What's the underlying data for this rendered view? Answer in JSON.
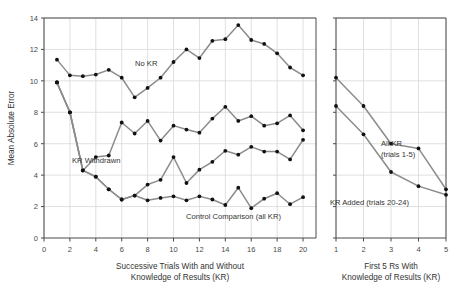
{
  "chart_data": {
    "type": "line",
    "title": "",
    "panels": [
      {
        "name": "left-panel",
        "xlabel": "Successive Trials With and Without Knowledge of Results (KR)",
        "xlabel_line1": "Successive Trials With and Without",
        "xlabel_line2": "Knowledge of Results (KR)",
        "ylabel": "Mean Absolute Error",
        "xlim": [
          0,
          21
        ],
        "ylim": [
          0,
          14
        ],
        "xticks": [
          0,
          2,
          4,
          6,
          8,
          10,
          12,
          14,
          16,
          18,
          20
        ],
        "yticks": [
          0,
          2,
          4,
          6,
          8,
          10,
          12,
          14
        ],
        "grid": true,
        "x": [
          1,
          2,
          3,
          4,
          5,
          6,
          7,
          8,
          9,
          10,
          11,
          12,
          13,
          14,
          15,
          16,
          17,
          18,
          19,
          20
        ],
        "series": [
          {
            "name": "No KR",
            "label": "No KR",
            "values": [
              11.35,
              10.35,
              10.3,
              10.4,
              10.7,
              10.2,
              8.95,
              9.55,
              10.2,
              11.2,
              12.0,
              11.45,
              12.55,
              12.65,
              13.55,
              12.6,
              12.35,
              11.75,
              10.85,
              10.35
            ]
          },
          {
            "name": "KR Withdrawn",
            "label": "KR Withdrawn",
            "values": [
              9.9,
              8.0,
              4.3,
              5.15,
              5.25,
              7.35,
              6.65,
              7.45,
              6.2,
              7.15,
              6.9,
              6.7,
              7.6,
              8.35,
              7.45,
              7.75,
              7.15,
              7.3,
              7.8,
              6.85
            ]
          },
          {
            "name": "Middle Series",
            "label": "",
            "values": [
              9.9,
              8.0,
              4.3,
              3.9,
              3.1,
              2.45,
              2.7,
              3.4,
              3.7,
              5.15,
              3.5,
              4.35,
              4.85,
              5.55,
              5.3,
              5.8,
              5.5,
              5.5,
              5.0,
              6.25
            ]
          },
          {
            "name": "Control Comparison (all KR)",
            "label": "Control Comparison (all KR)",
            "values": [
              9.9,
              8.0,
              4.3,
              3.9,
              3.1,
              2.45,
              2.7,
              2.4,
              2.55,
              2.65,
              2.4,
              2.65,
              2.45,
              2.1,
              3.2,
              1.9,
              2.5,
              2.85,
              2.15,
              2.6
            ]
          }
        ]
      },
      {
        "name": "right-panel",
        "xlabel": "First 5 Rs With Knowledge of Results (KR)",
        "xlabel_line1": "First 5 Rs With",
        "xlabel_line2": "Knowledge of Results (KR)",
        "ylabel": "",
        "xlim": [
          1,
          5
        ],
        "ylim": [
          0,
          14
        ],
        "xticks": [
          1,
          2,
          3,
          4,
          5
        ],
        "yticks": [
          0,
          2,
          4,
          6,
          8,
          10,
          12,
          14
        ],
        "grid": true,
        "x": [
          1,
          2,
          3,
          4,
          5
        ],
        "series": [
          {
            "name": "All KR (trials 1-5)",
            "label": "All KR",
            "label_line2": "(trials 1-5)",
            "values": [
              10.2,
              8.4,
              6.0,
              5.7,
              3.1
            ]
          },
          {
            "name": "KR Added (trials 20-24)",
            "label": "KR Added (trials 20-24)",
            "values": [
              8.4,
              6.6,
              4.2,
              3.3,
              2.75
            ]
          }
        ]
      }
    ],
    "legend_position": "inline-annotations",
    "colors": {
      "line": "#8c8c8c",
      "marker": "#111111",
      "grid": "#d8d8dc",
      "axis": "#4a4a4a",
      "background": "#ffffff"
    }
  }
}
